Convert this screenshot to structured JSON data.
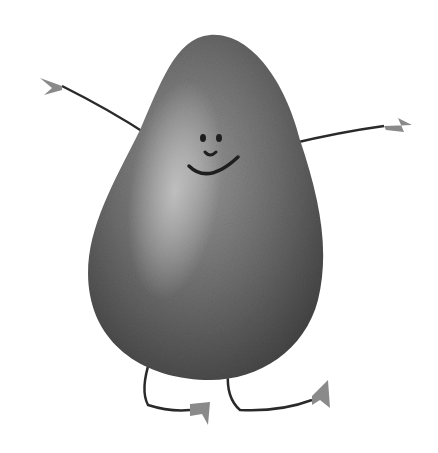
{
  "image": {
    "subject": "watercolor avocado character",
    "style": "grayscale watercolor illustration",
    "background": "#ffffff",
    "colors": {
      "body_dark": "#4a4a4a",
      "body_mid": "#7a7a7a",
      "highlight": "#b8b8b8",
      "line": "#2a2a2a",
      "hands": "#8a8a8a"
    },
    "features": [
      "smiling face",
      "two eyes",
      "outstretched arms",
      "bent legs",
      "small hands",
      "small feet"
    ]
  }
}
